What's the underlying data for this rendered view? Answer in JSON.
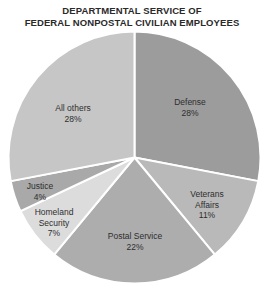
{
  "chart_data": {
    "type": "pie",
    "title": "DEPARTMENTAL SERVICE OF FEDERAL NONPOSTAL CIVILIAN EMPLOYEES",
    "title_lines": [
      "DEPARTMENTAL SERVICE OF",
      "FEDERAL NONPOSTAL CIVILIAN EMPLOYEES"
    ],
    "unit": "%",
    "start_angle_deg": 0,
    "direction": "clockwise",
    "slices": [
      {
        "label": "Defense",
        "label_lines": [
          "Defense"
        ],
        "value": 28,
        "value_text": "28%",
        "color": "#9c9c9c"
      },
      {
        "label": "Veterans Affairs",
        "label_lines": [
          "Veterans",
          "Affairs"
        ],
        "value": 11,
        "value_text": "11%",
        "color": "#b9b9b9"
      },
      {
        "label": "Postal Service",
        "label_lines": [
          "Postal Service"
        ],
        "value": 22,
        "value_text": "22%",
        "color": "#adadad"
      },
      {
        "label": "Homeland Security",
        "label_lines": [
          "Homeland",
          "Security"
        ],
        "value": 7,
        "value_text": "7%",
        "color": "#dcdcdc"
      },
      {
        "label": "Justice",
        "label_lines": [
          "Justice"
        ],
        "value": 4,
        "value_text": "4%",
        "color": "#a9a9a9"
      },
      {
        "label": "All others",
        "label_lines": [
          "All others"
        ],
        "value": 28,
        "value_text": "28%",
        "color": "#c6c6c6"
      }
    ],
    "legend": "none (labels inside slices)",
    "separator_color": "#ffffff"
  }
}
